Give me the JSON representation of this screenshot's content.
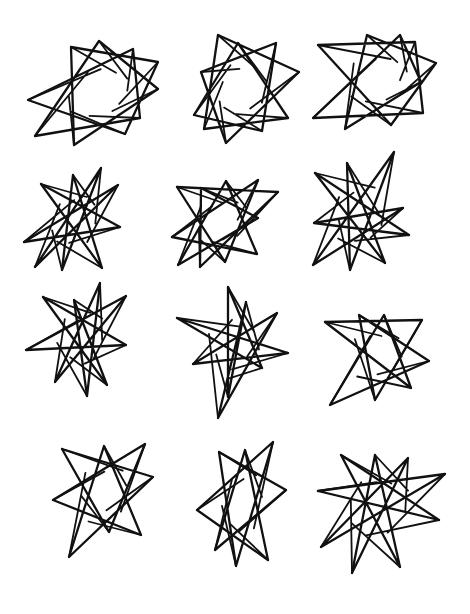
{
  "page": {
    "background": "#ffffff",
    "ink_color": "#111111",
    "grid": {
      "rows": 4,
      "cols": 3
    }
  },
  "stars": [
    {
      "id": 1,
      "row": 1,
      "col": 1,
      "skip": 3,
      "tips": [
        [
          71,
          47
        ],
        [
          99,
          41
        ],
        [
          133,
          49
        ],
        [
          158,
          62
        ],
        [
          158,
          89
        ],
        [
          140,
          118
        ],
        [
          125,
          134
        ],
        [
          74,
          145
        ],
        [
          35,
          136
        ],
        [
          28,
          100
        ]
      ]
    },
    {
      "id": 2,
      "row": 1,
      "col": 2,
      "skip": 3,
      "tips": [
        [
          218,
          35
        ],
        [
          238,
          43
        ],
        [
          276,
          43
        ],
        [
          299,
          72
        ],
        [
          288,
          118
        ],
        [
          262,
          131
        ],
        [
          226,
          143
        ],
        [
          204,
          129
        ],
        [
          194,
          115
        ],
        [
          201,
          72
        ]
      ]
    },
    {
      "id": 3,
      "row": 1,
      "col": 3,
      "skip": 3,
      "tips": [
        [
          367,
          35
        ],
        [
          400,
          35
        ],
        [
          415,
          42
        ],
        [
          436,
          63
        ],
        [
          421,
          82
        ],
        [
          423,
          113
        ],
        [
          391,
          125
        ],
        [
          345,
          129
        ],
        [
          313,
          118
        ],
        [
          318,
          45
        ]
      ]
    },
    {
      "id": 4,
      "row": 2,
      "col": 1,
      "skip": 4,
      "tips": [
        [
          41,
          184
        ],
        [
          73,
          175
        ],
        [
          101,
          168
        ],
        [
          118,
          185
        ],
        [
          120,
          227
        ],
        [
          102,
          268
        ],
        [
          62,
          270
        ],
        [
          35,
          267
        ],
        [
          24,
          242
        ]
      ]
    },
    {
      "id": 5,
      "row": 2,
      "col": 2,
      "skip": 4,
      "tips": [
        [
          177,
          187
        ],
        [
          201,
          188
        ],
        [
          226,
          181
        ],
        [
          258,
          180
        ],
        [
          278,
          192
        ],
        [
          258,
          218
        ],
        [
          257,
          254
        ],
        [
          225,
          262
        ],
        [
          200,
          267
        ],
        [
          178,
          265
        ],
        [
          172,
          237
        ]
      ]
    },
    {
      "id": 6,
      "row": 2,
      "col": 3,
      "skip": 4,
      "tips": [
        [
          347,
          163
        ],
        [
          394,
          152
        ],
        [
          403,
          208
        ],
        [
          409,
          235
        ],
        [
          385,
          263
        ],
        [
          350,
          270
        ],
        [
          313,
          265
        ],
        [
          314,
          223
        ],
        [
          315,
          173
        ]
      ]
    },
    {
      "id": 7,
      "row": 3,
      "col": 1,
      "skip": 4,
      "tips": [
        [
          43,
          297
        ],
        [
          74,
          300
        ],
        [
          100,
          283
        ],
        [
          126,
          296
        ],
        [
          126,
          345
        ],
        [
          107,
          385
        ],
        [
          87,
          396
        ],
        [
          55,
          382
        ],
        [
          26,
          350
        ]
      ]
    },
    {
      "id": 8,
      "row": 3,
      "col": 2,
      "skip": 4,
      "tips": [
        [
          228,
          287
        ],
        [
          246,
          302
        ],
        [
          277,
          313
        ],
        [
          288,
          353
        ],
        [
          262,
          368
        ],
        [
          228,
          397
        ],
        [
          218,
          418
        ],
        [
          193,
          364
        ],
        [
          177,
          318
        ]
      ]
    },
    {
      "id": 9,
      "row": 3,
      "col": 3,
      "skip": 3,
      "tips": [
        [
          325,
          322
        ],
        [
          359,
          315
        ],
        [
          384,
          315
        ],
        [
          422,
          320
        ],
        [
          429,
          361
        ],
        [
          411,
          388
        ],
        [
          375,
          400
        ],
        [
          330,
          405
        ]
      ]
    },
    {
      "id": 10,
      "row": 4,
      "col": 1,
      "skip": 3,
      "tips": [
        [
          62,
          449
        ],
        [
          104,
          446
        ],
        [
          145,
          444
        ],
        [
          153,
          477
        ],
        [
          141,
          535
        ],
        [
          109,
          532
        ],
        [
          69,
          557
        ],
        [
          53,
          500
        ]
      ]
    },
    {
      "id": 11,
      "row": 4,
      "col": 2,
      "skip": 3,
      "tips": [
        [
          219,
          452
        ],
        [
          245,
          450
        ],
        [
          273,
          442
        ],
        [
          286,
          490
        ],
        [
          268,
          560
        ],
        [
          236,
          566
        ],
        [
          215,
          550
        ],
        [
          197,
          510
        ]
      ]
    },
    {
      "id": 12,
      "row": 4,
      "col": 3,
      "skip": 4,
      "tips": [
        [
          341,
          455
        ],
        [
          375,
          455
        ],
        [
          408,
          458
        ],
        [
          445,
          474
        ],
        [
          439,
          520
        ],
        [
          400,
          567
        ],
        [
          352,
          573
        ],
        [
          321,
          547
        ],
        [
          318,
          491
        ]
      ]
    }
  ]
}
